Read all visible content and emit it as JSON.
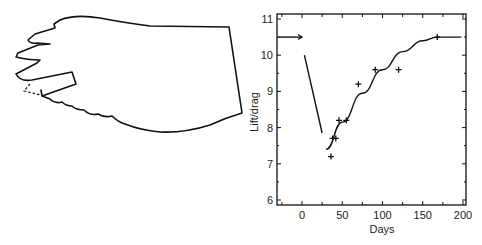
{
  "figure": {
    "left_panel": {
      "description": "wing outline with a missing/damaged feather section (dashed line)"
    },
    "right_panel": {
      "title": ""
    }
  },
  "chart_data": {
    "type": "scatter",
    "title": "",
    "xlabel": "Days",
    "ylabel": "Lift/drag",
    "xlim": [
      -30,
      205
    ],
    "ylim": [
      5.9,
      11.1
    ],
    "xticks": [
      0,
      50,
      100,
      150,
      200
    ],
    "yticks": [
      6,
      7,
      8,
      9,
      10,
      11
    ],
    "grid": false,
    "legend": null,
    "series": [
      {
        "name": "measurements",
        "marker": "+",
        "x": [
          -30,
          36,
          38,
          42,
          46,
          55,
          70,
          91,
          120,
          168
        ],
        "y": [
          10.5,
          7.2,
          7.7,
          7.7,
          8.2,
          8.2,
          9.2,
          9.6,
          9.6,
          10.5
        ]
      },
      {
        "name": "pre-damage level",
        "type": "line-arrow",
        "x": [
          -30,
          0
        ],
        "y": [
          10.5,
          10.5
        ]
      },
      {
        "name": "drop after damage",
        "type": "line",
        "x": [
          3,
          25
        ],
        "y": [
          10.0,
          7.85
        ]
      },
      {
        "name": "recovery fit",
        "type": "line",
        "x": [
          30,
          50,
          75,
          100,
          125,
          150,
          168,
          198
        ],
        "y": [
          7.4,
          8.15,
          8.95,
          9.6,
          10.1,
          10.4,
          10.5,
          10.5
        ]
      }
    ]
  }
}
